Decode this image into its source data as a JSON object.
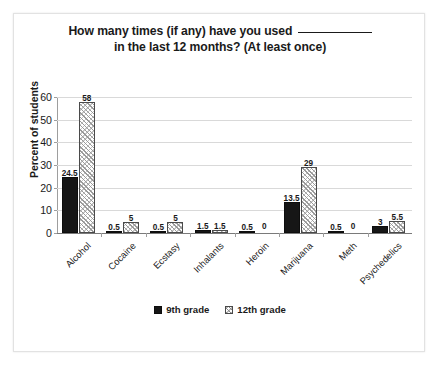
{
  "chart_data": {
    "type": "bar",
    "title_line1_prefix": "How many times (if any) have you used ",
    "title_line2": "in the last 12 months? (At least once)",
    "xlabel": "",
    "ylabel": "Percent of students",
    "ylim": [
      0,
      60
    ],
    "ytick_step": 10,
    "yticks": [
      0,
      10,
      20,
      30,
      40,
      50,
      60
    ],
    "grid": true,
    "legend_position": "bottom",
    "categories": [
      "Alcohol",
      "Cocaine",
      "Ecstasy",
      "Inhalants",
      "Heroin",
      "Marijuana",
      "Meth",
      "Psychedelics"
    ],
    "series": [
      {
        "name": "9th grade",
        "fill": "solid-black",
        "color": "#161616",
        "values": [
          24.5,
          0.5,
          0.5,
          1.5,
          0.5,
          13.5,
          0.5,
          3
        ],
        "labels": [
          "24.5",
          "0.5",
          "0.5",
          "1.5",
          "0.5",
          "13.5",
          "0.5",
          "3"
        ]
      },
      {
        "name": "12th grade",
        "fill": "diagonal-hatch",
        "color": "#ffffff",
        "values": [
          58,
          5,
          5,
          1.5,
          0,
          29,
          0,
          5.5
        ],
        "labels": [
          "58",
          "5",
          "5",
          "1.5",
          "0",
          "29",
          "0",
          "5.5"
        ]
      }
    ]
  },
  "colors": {
    "series_9_grade": "#161616",
    "series_12_grade": "#ffffff",
    "gridline": "#d9d9d9",
    "axis": "#9e9e9e",
    "text": "#1a1a1a",
    "frame_border": "#e2e2e2",
    "background": "#ffffff"
  }
}
